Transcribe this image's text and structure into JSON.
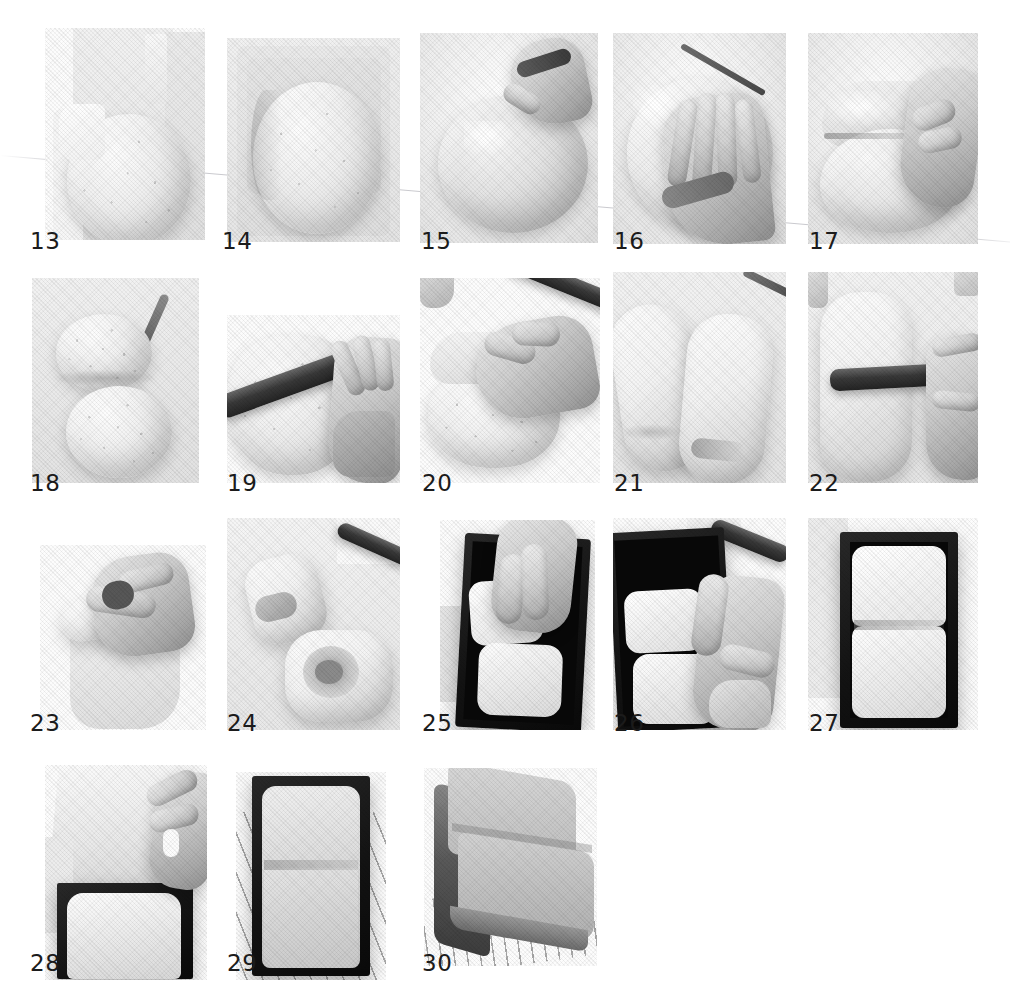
{
  "document": {
    "kind": "photo-step-sequence",
    "subject": "bread dough shaping and baking steps",
    "background_color": "#ffffff",
    "number_color": "#1b1b1b",
    "page_width": 1010,
    "page_height": 999
  },
  "steps": [
    {
      "number": "13",
      "caption_x": 30,
      "caption_y": 230,
      "x": 45,
      "y": 28,
      "w": 160,
      "h": 212,
      "scene": "risen-dough-in-container"
    },
    {
      "number": "14",
      "caption_x": 222,
      "caption_y": 230,
      "x": 227,
      "y": 38,
      "w": 173,
      "h": 204,
      "scene": "risen-dough-top-view"
    },
    {
      "number": "15",
      "caption_x": 421,
      "caption_y": 230,
      "x": 420,
      "y": 33,
      "w": 178,
      "h": 210,
      "scene": "hand-pinching-dough"
    },
    {
      "number": "16",
      "caption_x": 614,
      "caption_y": 230,
      "x": 613,
      "y": 33,
      "w": 173,
      "h": 211,
      "scene": "hand-flattening-dough"
    },
    {
      "number": "17",
      "caption_x": 809,
      "caption_y": 230,
      "x": 808,
      "y": 33,
      "w": 170,
      "h": 211,
      "scene": "hand-folding-dough"
    },
    {
      "number": "18",
      "caption_x": 30,
      "caption_y": 472,
      "x": 32,
      "y": 278,
      "w": 167,
      "h": 205,
      "scene": "two-dough-balls-resting"
    },
    {
      "number": "19",
      "caption_x": 227,
      "caption_y": 472,
      "x": 227,
      "y": 315,
      "w": 173,
      "h": 168,
      "scene": "rolling-pin-flatten"
    },
    {
      "number": "20",
      "caption_x": 422,
      "caption_y": 472,
      "x": 420,
      "y": 278,
      "w": 180,
      "h": 205,
      "scene": "hand-rolling-dough"
    },
    {
      "number": "21",
      "caption_x": 614,
      "caption_y": 472,
      "x": 613,
      "y": 272,
      "w": 173,
      "h": 211,
      "scene": "two-rolled-logs"
    },
    {
      "number": "22",
      "caption_x": 809,
      "caption_y": 472,
      "x": 808,
      "y": 272,
      "w": 170,
      "h": 211,
      "scene": "rolling-pin-second-pass"
    },
    {
      "number": "23",
      "caption_x": 30,
      "caption_y": 712,
      "x": 40,
      "y": 545,
      "w": 166,
      "h": 185,
      "scene": "hand-rolling-into-coil"
    },
    {
      "number": "24",
      "caption_x": 227,
      "caption_y": 712,
      "x": 227,
      "y": 518,
      "w": 173,
      "h": 212,
      "scene": "two-coiled-rolls"
    },
    {
      "number": "25",
      "caption_x": 422,
      "caption_y": 712,
      "x": 440,
      "y": 520,
      "w": 155,
      "h": 210,
      "scene": "placing-rolls-in-tin"
    },
    {
      "number": "26",
      "caption_x": 614,
      "caption_y": 712,
      "x": 613,
      "y": 518,
      "w": 173,
      "h": 212,
      "scene": "adjusting-rolls-in-tin"
    },
    {
      "number": "27",
      "caption_x": 809,
      "caption_y": 712,
      "x": 808,
      "y": 518,
      "w": 170,
      "h": 212,
      "scene": "tin-with-two-rolls"
    },
    {
      "number": "28",
      "caption_x": 30,
      "caption_y": 952,
      "x": 45,
      "y": 765,
      "w": 162,
      "h": 215,
      "scene": "lidding-the-tin"
    },
    {
      "number": "29",
      "caption_x": 227,
      "caption_y": 952,
      "x": 236,
      "y": 772,
      "w": 150,
      "h": 208,
      "scene": "baked-loaf-in-tin"
    },
    {
      "number": "30",
      "caption_x": 422,
      "caption_y": 952,
      "x": 424,
      "y": 768,
      "w": 173,
      "h": 198,
      "scene": "finished-loaf-on-rack"
    }
  ]
}
